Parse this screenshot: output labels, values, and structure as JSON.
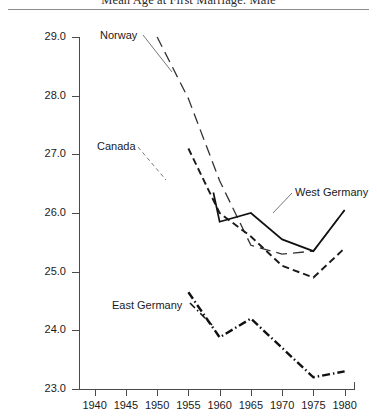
{
  "chart_data": {
    "type": "line",
    "title": "Mean Age at First Marriage: Male",
    "xlabel": "",
    "ylabel": "Age (Years)",
    "xlim": [
      1937.5,
      1981.5
    ],
    "ylim": [
      23.0,
      29.0
    ],
    "grid": false,
    "legend_position": "inline-annotations",
    "xticks": [
      1940,
      1945,
      1950,
      1955,
      1960,
      1965,
      1970,
      1975,
      1980
    ],
    "yticks": [
      "23.0",
      "24.0",
      "25.0",
      "26.0",
      "27.0",
      "28.0",
      "29.0"
    ],
    "series": [
      {
        "name": "Norway",
        "style": "long-dash",
        "color": "#333333",
        "x": [
          1950,
          1955,
          1960,
          1965,
          1970,
          1975,
          1980
        ],
        "values": [
          29.0,
          27.95,
          26.55,
          25.45,
          25.3,
          25.35,
          26.05
        ]
      },
      {
        "name": "Canada",
        "style": "dash",
        "color": "#1a1a1a",
        "x": [
          1955,
          1960,
          1965,
          1970,
          1975,
          1980
        ],
        "values": [
          27.1,
          26.0,
          25.6,
          25.1,
          24.9,
          25.4
        ]
      },
      {
        "name": "West Germany",
        "style": "solid",
        "color": "#111111",
        "x": [
          1959,
          1960,
          1965,
          1970,
          1975,
          1980
        ],
        "values": [
          26.35,
          25.85,
          26.0,
          25.55,
          25.35,
          26.05
        ]
      },
      {
        "name": "East Germany",
        "style": "dash-dot",
        "color": "#111111",
        "x": [
          1955,
          1960,
          1965,
          1970,
          1975,
          1980
        ],
        "values": [
          24.65,
          23.88,
          24.2,
          23.7,
          23.2,
          23.3
        ]
      }
    ]
  },
  "labels": {
    "norway": "Norway",
    "canada": "Canada",
    "west_germany": "West Germany",
    "east_germany": "East Germany"
  }
}
